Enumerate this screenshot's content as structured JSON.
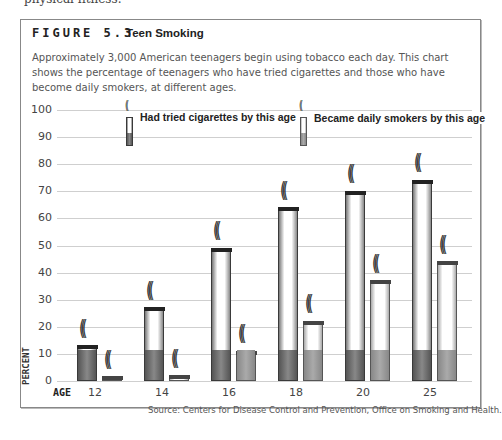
{
  "page": {
    "top_text": "physical fitness."
  },
  "figure": {
    "label": "FIGURE 5.3",
    "title": "Teen Smoking",
    "description": "Approximately 3,000 American teenagers begin using tobacco each day. This chart shows the percentage of teenagers who have tried cigarettes and those who have become daily smokers, at different ages.",
    "source": "Source: Centers for Disease Control and Prevention, Office on Smoking and Health."
  },
  "chart_data": {
    "type": "bar",
    "title": "Teen Smoking",
    "xlabel": "AGE",
    "ylabel": "PERCENT",
    "ylim": [
      0,
      100
    ],
    "yticks": [
      "0",
      "10",
      "20",
      "30",
      "40",
      "50",
      "60",
      "70",
      "80",
      "90",
      "100"
    ],
    "categories": [
      "12",
      "14",
      "16",
      "18",
      "20",
      "25"
    ],
    "series": [
      {
        "name": "Had tried cigarettes by this age",
        "values": [
          13,
          27,
          49,
          64,
          70,
          74
        ],
        "color": "#555555"
      },
      {
        "name": "Became daily smokers by this age",
        "values": [
          1.5,
          2,
          11,
          22,
          37,
          44
        ],
        "color": "#999999"
      }
    ],
    "grid": true,
    "legend_position": "top"
  },
  "legend": {
    "tried": "Had tried cigarettes by this age",
    "daily": "Became daily smokers by this age"
  },
  "axis": {
    "age_label": "AGE",
    "percent_label": "PERCENT"
  }
}
